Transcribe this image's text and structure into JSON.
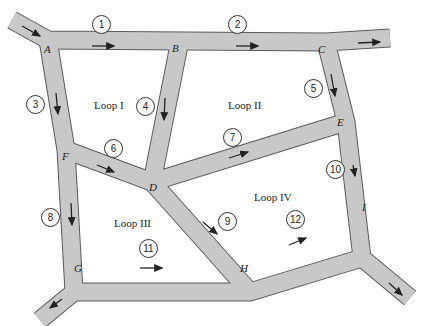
{
  "diagram": {
    "type": "traffic-network",
    "colors": {
      "road": "#c8c8c8",
      "road_edge": "#5a5a5a",
      "arrow": "#222222"
    },
    "nodes": [
      {
        "id": "A",
        "label": "A"
      },
      {
        "id": "B",
        "label": "B"
      },
      {
        "id": "C",
        "label": "C"
      },
      {
        "id": "D",
        "label": "D"
      },
      {
        "id": "E",
        "label": "E"
      },
      {
        "id": "F",
        "label": "F"
      },
      {
        "id": "G",
        "label": "G"
      },
      {
        "id": "H",
        "label": "H"
      },
      {
        "id": "I",
        "label": "I"
      }
    ],
    "loops": [
      {
        "label": "Loop I"
      },
      {
        "label": "Loop II"
      },
      {
        "label": "Loop III"
      },
      {
        "label": "Loop IV"
      }
    ],
    "edges": [
      {
        "num": "1",
        "from": "A",
        "to": "B"
      },
      {
        "num": "2",
        "from": "B",
        "to": "C"
      },
      {
        "num": "3",
        "from": "A",
        "to": "F"
      },
      {
        "num": "4",
        "from": "B",
        "to": "D"
      },
      {
        "num": "5",
        "from": "C",
        "to": "E"
      },
      {
        "num": "6",
        "from": "F",
        "to": "D"
      },
      {
        "num": "7",
        "from": "D",
        "to": "E"
      },
      {
        "num": "8",
        "from": "F",
        "to": "G"
      },
      {
        "num": "9",
        "from": "D",
        "to": "H"
      },
      {
        "num": "10",
        "from": "E",
        "to": "I"
      },
      {
        "num": "11",
        "from": "G",
        "to": "H"
      },
      {
        "num": "12",
        "from": "H",
        "to": "I"
      }
    ],
    "external": [
      {
        "desc": "inflow into A from upper-left"
      },
      {
        "desc": "outflow from C to the right"
      },
      {
        "desc": "outflow from G to lower-left"
      },
      {
        "desc": "outflow from I to lower-right"
      }
    ]
  }
}
